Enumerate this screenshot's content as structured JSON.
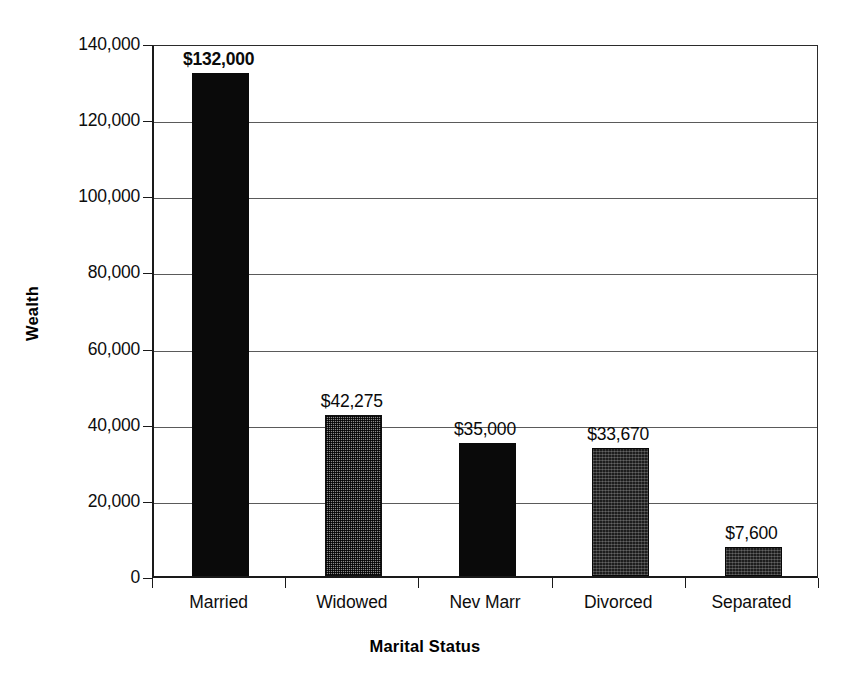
{
  "chart_data": {
    "type": "bar",
    "title": "",
    "xlabel": "Marital Status",
    "ylabel": "Wealth",
    "categories": [
      "Married",
      "Widowed",
      "Nev Marr",
      "Divorced",
      "Separated"
    ],
    "values": [
      132000,
      42275,
      35000,
      33670,
      7600
    ],
    "value_labels": [
      "$132,000",
      "$42,275",
      "$35,000",
      "$33,670",
      "$7,600"
    ],
    "bar_fills": [
      "solid-black",
      "dithered-gray",
      "solid-black",
      "dark-speckle",
      "dark-speckle"
    ],
    "ylim": [
      0,
      140000
    ],
    "ytick_values": [
      0,
      20000,
      40000,
      60000,
      80000,
      100000,
      120000,
      140000
    ],
    "ytick_labels": [
      "0",
      "20,000",
      "40,000",
      "60,000",
      "80,000",
      "100,000",
      "120,000",
      "140,000"
    ],
    "grid": "horizontal",
    "legend": "none",
    "colors": {
      "axis": "#1a1a1a",
      "gridline": "#5a5a5a",
      "bar_solid": "#0a0a0a",
      "bar_gray": "#8a8a8a",
      "bar_speckle": "#1d1d1d",
      "background": "#ffffff",
      "text": "#0d0d0d"
    }
  }
}
